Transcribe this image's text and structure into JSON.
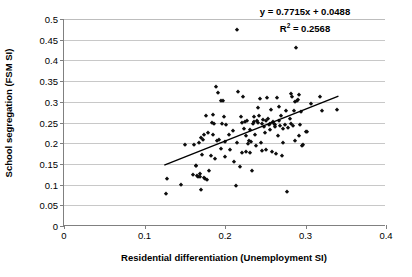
{
  "chart_data": {
    "type": "scatter",
    "title": "",
    "xlabel": "Residential differentiation (Unemployment SI)",
    "ylabel": "School segregation (FSM SI)",
    "xlim": [
      0,
      0.4
    ],
    "ylim": [
      0,
      0.5
    ],
    "xticks": [
      0,
      0.1,
      0.2,
      0.3,
      0.4
    ],
    "xtick_labels": [
      "0",
      "0.1",
      "0.2",
      "0.3",
      "0.4"
    ],
    "yticks": [
      0,
      0.05,
      0.1,
      0.15,
      0.2,
      0.25,
      0.3,
      0.35,
      0.4,
      0.45,
      0.5
    ],
    "ytick_labels": [
      "0",
      "0.05",
      "0.1",
      "0.15",
      "0.2",
      "0.25",
      "0.3",
      "0.35",
      "0.4",
      "0.45",
      "0.5"
    ],
    "grid": "horizontal",
    "legend": "none",
    "marker": "diamond",
    "marker_color": "#0d0d0d",
    "annotations": {
      "equation": "y = 0.7715x + 0.0488",
      "r_squared_prefix": "R",
      "r_squared_exponent": "2",
      "r_squared_value": " = 0.2568",
      "r_squared_full": "R2 = 0.2568"
    },
    "trendline": {
      "slope": 0.7715,
      "intercept": 0.0488,
      "x_start": 0.125,
      "x_end": 0.342,
      "color": "#000000"
    },
    "points": [
      [
        0.1265,
        0.0765
      ],
      [
        0.1275,
        0.1125
      ],
      [
        0.1455,
        0.099
      ],
      [
        0.1505,
        0.195
      ],
      [
        0.1605,
        0.1225
      ],
      [
        0.1615,
        0.1955
      ],
      [
        0.1635,
        0.1455
      ],
      [
        0.1645,
        0.145
      ],
      [
        0.1655,
        0.1215
      ],
      [
        0.1665,
        0.1195
      ],
      [
        0.1675,
        0.2
      ],
      [
        0.1685,
        0.125
      ],
      [
        0.169,
        0.1185
      ],
      [
        0.17,
        0.088
      ],
      [
        0.1705,
        0.2115
      ],
      [
        0.1715,
        0.172
      ],
      [
        0.1725,
        0.2085
      ],
      [
        0.174,
        0.1165
      ],
      [
        0.1745,
        0.22
      ],
      [
        0.1755,
        0.114
      ],
      [
        0.1765,
        0.2645
      ],
      [
        0.1775,
        0.1115
      ],
      [
        0.1795,
        0.2235
      ],
      [
        0.1805,
        0.1325
      ],
      [
        0.1825,
        0.17
      ],
      [
        0.1835,
        0.248
      ],
      [
        0.1845,
        0.268
      ],
      [
        0.1855,
        0.219
      ],
      [
        0.1865,
        0.2475
      ],
      [
        0.1875,
        0.161
      ],
      [
        0.1885,
        0.335
      ],
      [
        0.1905,
        0.2055
      ],
      [
        0.1915,
        0.321
      ],
      [
        0.1925,
        0.207
      ],
      [
        0.1945,
        0.3015
      ],
      [
        0.1955,
        0.186
      ],
      [
        0.1965,
        0.246
      ],
      [
        0.1975,
        0.302
      ],
      [
        0.1985,
        0.264
      ],
      [
        0.1995,
        0.2025
      ],
      [
        0.2005,
        0.1665
      ],
      [
        0.2015,
        0.243
      ],
      [
        0.2055,
        0.2205
      ],
      [
        0.2065,
        0.1845
      ],
      [
        0.2095,
        0.2295
      ],
      [
        0.2115,
        0.155
      ],
      [
        0.2135,
        0.097
      ],
      [
        0.2145,
        0.474
      ],
      [
        0.2155,
        0.201
      ],
      [
        0.2165,
        0.3245
      ],
      [
        0.2185,
        0.1435
      ],
      [
        0.2195,
        0.264
      ],
      [
        0.2205,
        0.248
      ],
      [
        0.2215,
        0.1765
      ],
      [
        0.2225,
        0.3105
      ],
      [
        0.2235,
        0.2355
      ],
      [
        0.2245,
        0.251
      ],
      [
        0.2255,
        0.2165
      ],
      [
        0.2265,
        0.1795
      ],
      [
        0.2275,
        0.2545
      ],
      [
        0.2285,
        0.1975
      ],
      [
        0.2295,
        0.2055
      ],
      [
        0.2305,
        0.1755
      ],
      [
        0.2315,
        0.233
      ],
      [
        0.2325,
        0.202
      ],
      [
        0.2335,
        0.132
      ],
      [
        0.2345,
        0.2475
      ],
      [
        0.2355,
        0.2625
      ],
      [
        0.2365,
        0.2515
      ],
      [
        0.2375,
        0.2195
      ],
      [
        0.2385,
        0.193
      ],
      [
        0.2395,
        0.254
      ],
      [
        0.2405,
        0.248
      ],
      [
        0.2415,
        0.2855
      ],
      [
        0.2425,
        0.2665
      ],
      [
        0.2435,
        0.3075
      ],
      [
        0.2445,
        0.201
      ],
      [
        0.2455,
        0.2465
      ],
      [
        0.2465,
        0.182
      ],
      [
        0.2475,
        0.2555
      ],
      [
        0.2485,
        0.24
      ],
      [
        0.2495,
        0.224
      ],
      [
        0.2505,
        0.2525
      ],
      [
        0.2515,
        0.184
      ],
      [
        0.2525,
        0.309
      ],
      [
        0.2535,
        0.258
      ],
      [
        0.2545,
        0.2435
      ],
      [
        0.2555,
        0.233
      ],
      [
        0.2565,
        0.246
      ],
      [
        0.2575,
        0.2795
      ],
      [
        0.2585,
        0.1785
      ],
      [
        0.2595,
        0.251
      ],
      [
        0.2605,
        0.2455
      ],
      [
        0.2615,
        0.238
      ],
      [
        0.2625,
        0.2435
      ],
      [
        0.2635,
        0.1745
      ],
      [
        0.2645,
        0.3095
      ],
      [
        0.2655,
        0.2185
      ],
      [
        0.2665,
        0.288
      ],
      [
        0.2675,
        0.253
      ],
      [
        0.2685,
        0.242
      ],
      [
        0.2695,
        0.2665
      ],
      [
        0.2705,
        0.168
      ],
      [
        0.2715,
        0.2345
      ],
      [
        0.2725,
        0.2015
      ],
      [
        0.2745,
        0.243
      ],
      [
        0.2755,
        0.277
      ],
      [
        0.2775,
        0.081
      ],
      [
        0.2785,
        0.237
      ],
      [
        0.2805,
        0.2595
      ],
      [
        0.2815,
        0.2455
      ],
      [
        0.2825,
        0.3195
      ],
      [
        0.2835,
        0.311
      ],
      [
        0.2845,
        0.242
      ],
      [
        0.2855,
        0.277
      ],
      [
        0.2865,
        0.206
      ],
      [
        0.2875,
        0.2995
      ],
      [
        0.2885,
        0.429
      ],
      [
        0.2895,
        0.303
      ],
      [
        0.2905,
        0.3055
      ],
      [
        0.2915,
        0.3175
      ],
      [
        0.2925,
        0.2185
      ],
      [
        0.2935,
        0.244
      ],
      [
        0.2945,
        0.276
      ],
      [
        0.2955,
        0.1935
      ],
      [
        0.2965,
        0.1965
      ],
      [
        0.3005,
        0.228
      ],
      [
        0.3015,
        0.226
      ],
      [
        0.3065,
        0.2945
      ],
      [
        0.3175,
        0.3125
      ],
      [
        0.3205,
        0.2785
      ],
      [
        0.3395,
        0.279
      ]
    ]
  }
}
